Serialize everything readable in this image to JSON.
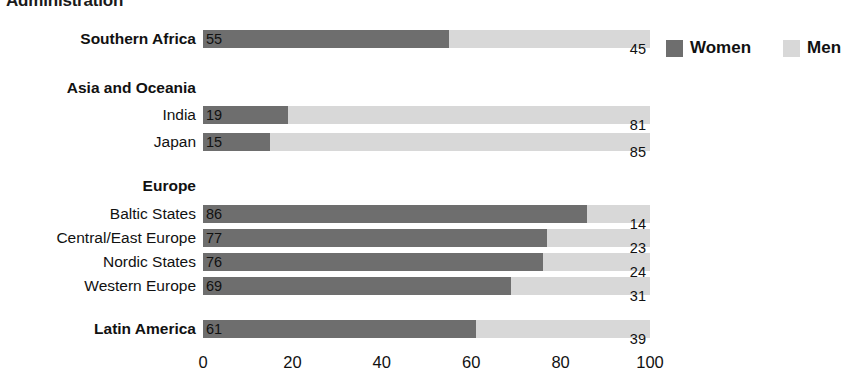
{
  "title_cropped": "Administration",
  "legend": {
    "items": [
      {
        "label": "Women",
        "color": "#6e6e6e",
        "key": "women"
      },
      {
        "label": "Men",
        "color": "#d8d8d8",
        "key": "men"
      }
    ]
  },
  "axis": {
    "ticks": [
      "0",
      "20",
      "40",
      "60",
      "80",
      "100"
    ],
    "min": 0,
    "max": 100
  },
  "rows": [
    {
      "type": "group-bar",
      "label": "Southern Africa",
      "bold": true,
      "women": 55,
      "men": 45,
      "women_label": "55",
      "men_label": "45",
      "top": 30
    },
    {
      "type": "group",
      "label": "Asia and Oceania",
      "bold": true,
      "top": 79
    },
    {
      "type": "bar",
      "label": "India",
      "bold": false,
      "women": 19,
      "men": 81,
      "women_label": "19",
      "men_label": "81",
      "top": 106
    },
    {
      "type": "bar",
      "label": "Japan",
      "bold": false,
      "women": 15,
      "men": 85,
      "women_label": "15",
      "men_label": "85",
      "top": 133
    },
    {
      "type": "group",
      "label": "Europe",
      "bold": true,
      "top": 177
    },
    {
      "type": "bar",
      "label": "Baltic States",
      "bold": false,
      "women": 86,
      "men": 14,
      "women_label": "86",
      "men_label": "14",
      "top": 205
    },
    {
      "type": "bar",
      "label": "Central/East Europe",
      "bold": false,
      "women": 77,
      "men": 23,
      "women_label": "77",
      "men_label": "23",
      "top": 229
    },
    {
      "type": "bar",
      "label": "Nordic States",
      "bold": false,
      "women": 76,
      "men": 24,
      "women_label": "76",
      "men_label": "24",
      "top": 253
    },
    {
      "type": "bar",
      "label": "Western Europe",
      "bold": false,
      "women": 69,
      "men": 31,
      "women_label": "69",
      "men_label": "31",
      "top": 277
    },
    {
      "type": "group-bar",
      "label": "Latin America",
      "bold": true,
      "women": 61,
      "men": 39,
      "women_label": "61",
      "men_label": "39",
      "top": 320
    }
  ],
  "chart_data": {
    "type": "bar",
    "subtype": "stacked-horizontal-100",
    "title": "Administration",
    "xlabel": "",
    "ylabel": "",
    "xlim": [
      0,
      100
    ],
    "xticks": [
      0,
      20,
      40,
      60,
      80,
      100
    ],
    "grid": false,
    "legend_position": "top-right",
    "categories": [
      "Southern Africa",
      "India",
      "Japan",
      "Baltic States",
      "Central/East Europe",
      "Nordic States",
      "Western Europe",
      "Latin America"
    ],
    "category_groups": {
      "Southern Africa": "Southern Africa",
      "India": "Asia and Oceania",
      "Japan": "Asia and Oceania",
      "Baltic States": "Europe",
      "Central/East Europe": "Europe",
      "Nordic States": "Europe",
      "Western Europe": "Europe",
      "Latin America": "Latin America"
    },
    "series": [
      {
        "name": "Women",
        "color": "#6e6e6e",
        "values": [
          55,
          19,
          15,
          86,
          77,
          76,
          69,
          61
        ]
      },
      {
        "name": "Men",
        "color": "#d8d8d8",
        "values": [
          45,
          81,
          85,
          14,
          23,
          24,
          31,
          39
        ]
      }
    ]
  }
}
